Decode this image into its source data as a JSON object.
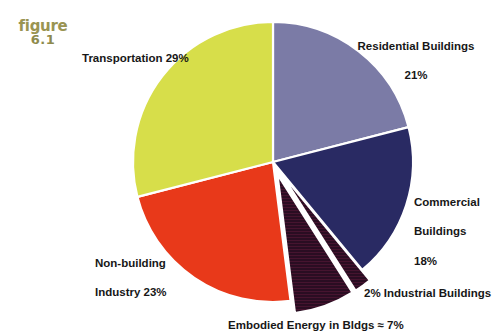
{
  "figure": {
    "word": "figure",
    "number": "6.1"
  },
  "chart_data": {
    "type": "pie",
    "title": "",
    "subtitle": "",
    "xlabel": "",
    "ylabel": "",
    "legend_position": "none",
    "grid": false,
    "units": "percent",
    "total": 100,
    "labels": [
      "Residential Buildings",
      "Commercial Buildings",
      "Industrial Buildings",
      "Embodied Energy in Bldgs",
      "Non-building Industry",
      "Transportation"
    ],
    "values": [
      21,
      18,
      2,
      7,
      23,
      29
    ],
    "colors": [
      "#7b7ba6",
      "#292a63",
      "#2a0d22",
      "#2a0d22",
      "#e8391a",
      "#d7de4a"
    ],
    "slices": [
      {
        "name": "Residential Buildings",
        "value": 21,
        "value_text": "21%",
        "color": "#7b7ba6",
        "exploded": false,
        "hatched": false,
        "start_deg": 0,
        "end_deg": 75.6
      },
      {
        "name": "Commercial Buildings",
        "value": 18,
        "value_text": "18%",
        "color": "#292a63",
        "exploded": false,
        "hatched": false,
        "start_deg": 75.6,
        "end_deg": 140.4
      },
      {
        "name": "Industrial Buildings",
        "value": 2,
        "value_text": "2%",
        "color": "#2a0d22",
        "exploded": true,
        "hatched": true,
        "start_deg": 140.4,
        "end_deg": 147.6
      },
      {
        "name": "Embodied Energy in Bldgs",
        "value": 7,
        "value_text": "7%",
        "approximate": true,
        "color": "#2a0d22",
        "exploded": true,
        "hatched": true,
        "start_deg": 147.6,
        "end_deg": 172.8
      },
      {
        "name": "Non-building Industry",
        "value": 23,
        "value_text": "23%",
        "color": "#e8391a",
        "exploded": false,
        "hatched": false,
        "start_deg": 172.8,
        "end_deg": 255.6
      },
      {
        "name": "Transportation",
        "value": 29,
        "value_text": "29%",
        "color": "#d7de4a",
        "exploded": false,
        "hatched": false,
        "start_deg": 255.6,
        "end_deg": 360
      }
    ]
  },
  "callouts": {
    "transportation": {
      "text": "Transportation 29%"
    },
    "residential": {
      "line1": "Residential Buildings",
      "line2": "21%"
    },
    "commercial": {
      "line1": "Commercial",
      "line2": "Buildings",
      "line3": "18%"
    },
    "industrial": {
      "text": "2% Industrial Buildings"
    },
    "embodied": {
      "text": "Embodied Energy in Bldgs ≈ 7%"
    },
    "nonbuilding": {
      "line1": "Non-building",
      "line2": "Industry  23%"
    }
  }
}
